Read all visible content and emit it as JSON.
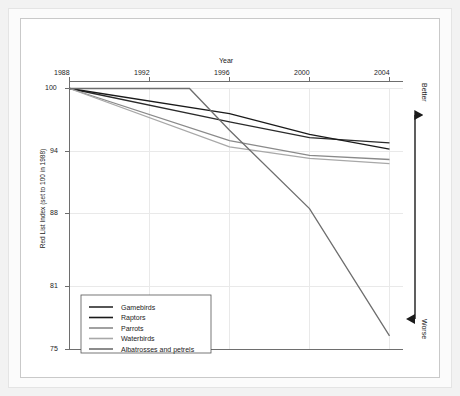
{
  "chart_data": {
    "type": "line",
    "title": "",
    "xlabel": "Year",
    "ylabel": "Red List Index (set to 100 in 1988)",
    "x": [
      1988,
      1992,
      1996,
      2000,
      2004
    ],
    "xticks": [
      "1988",
      "1992",
      "1996",
      "2000",
      "2004"
    ],
    "yticks": [
      "100",
      "94",
      "88",
      "81",
      "75"
    ],
    "ytick_values": [
      100,
      94,
      88,
      81,
      75
    ],
    "xlim": [
      1988,
      2004
    ],
    "ylim": [
      75,
      100
    ],
    "grid": true,
    "legend_position": "bottom-left",
    "xaxis_position": "top",
    "series": [
      {
        "name": "Gamebirds",
        "color": "#2b2b2b",
        "x": [
          1988,
          1996,
          2000,
          2004
        ],
        "values": [
          100,
          96.8,
          95.3,
          94.8
        ]
      },
      {
        "name": "Raptors",
        "color": "#1a1a1a",
        "x": [
          1988,
          1996,
          2000,
          2004
        ],
        "values": [
          100,
          97.6,
          95.6,
          94.2
        ]
      },
      {
        "name": "Parrots",
        "color": "#8a8a8a",
        "x": [
          1988,
          1996,
          2000,
          2004
        ],
        "values": [
          100,
          95.0,
          93.6,
          93.2
        ]
      },
      {
        "name": "Waterbirds",
        "color": "#a8a8a8",
        "x": [
          1988,
          1996,
          2000,
          2004
        ],
        "values": [
          100,
          94.4,
          93.3,
          92.8
        ]
      },
      {
        "name": "Albatrosses and petrels",
        "color": "#6e6e6e",
        "x": [
          1988,
          1994,
          1996,
          2000,
          2004
        ],
        "values": [
          100,
          100,
          96.0,
          88.5,
          76.3
        ]
      }
    ],
    "annotations": [
      {
        "text": "Better",
        "position": "right-top"
      },
      {
        "text": "Worse",
        "position": "right-bottom"
      }
    ]
  },
  "axis": {
    "year_title": "Year",
    "y_title": "Red List Index (set to 100 in 1988)",
    "xticks": [
      "1988",
      "1992",
      "1996",
      "2000",
      "2004"
    ],
    "yticks": [
      "100",
      "94",
      "88",
      "81",
      "75"
    ]
  },
  "direction": {
    "better": "Better",
    "worse": "Worse"
  },
  "legend": {
    "items": [
      {
        "label": "Gamebirds"
      },
      {
        "label": "Raptors"
      },
      {
        "label": "Parrots"
      },
      {
        "label": "Waterbirds"
      },
      {
        "label": "Albatrosses and petrels"
      }
    ]
  },
  "colors": {
    "panel_background": "#ffffff",
    "frame_background": "#f2f2f2",
    "grid": "#e6e6e6",
    "axis": "#6b6b6b",
    "text": "#1b1b1b"
  }
}
